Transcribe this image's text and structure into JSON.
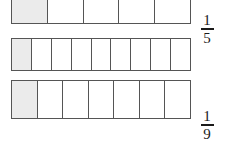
{
  "figure": {
    "type": "fraction-bar-diagram",
    "background_color": "#ffffff",
    "border_color": "#555555",
    "shaded_color": "#ebebeb",
    "unshaded_color": "#ffffff",
    "text_color": "#1a1a1a"
  },
  "bars": [
    {
      "id": "bar-fifths",
      "parts": 5,
      "shaded_parts": 1,
      "fraction": {
        "numerator": "1",
        "denominator": "5",
        "text": "1/5"
      }
    },
    {
      "id": "bar-ninths",
      "parts": 9,
      "shaded_parts": 1,
      "fraction": {
        "numerator": "1",
        "denominator": "9",
        "text": "1/9"
      }
    },
    {
      "id": "bar-sevenths",
      "parts": 7,
      "shaded_parts": 1,
      "fraction": {
        "numerator": "1",
        "denominator": "7",
        "text": "1/7"
      }
    }
  ]
}
